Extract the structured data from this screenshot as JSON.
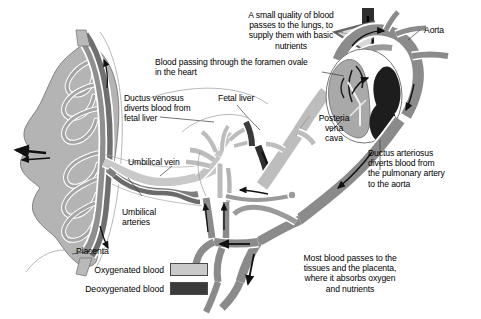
{
  "diagram": {
    "type": "anatomical-diagram"
  },
  "annotations": {
    "lungs_note": "A small quality of blood\npasses to the lungs, to\nsupply them with basic\nnutrients",
    "aorta": "Aorta",
    "foramen_ovale": "Blood passing through the foramen ovale\nin the heart",
    "ductus_venosus": "Ductus venosus\ndiverts blood from\nfetal liver",
    "fetal_liver": "Fetal liver",
    "posterior_vena_cava": "Posteria\nvena\ncava",
    "ductus_arteriosus": "Ductus arteriosus\ndiverts blood from\nthe pulmonary artery\nto the aorta",
    "umbilical_vein": "Umbilical vein",
    "umbilical_arteries": "Umbilical\narteries",
    "placenta": "Placenta",
    "tissues_note": "Most blood passes to the\ntissues and the placenta,\nwhere it absorbs oxygen\nand nutrients"
  },
  "legend": {
    "items": [
      {
        "label": "Oxygenated blood",
        "color": "#c9c9c9"
      },
      {
        "label": "Deoxygenated blood",
        "color": "#3b3b3b"
      }
    ]
  },
  "colors": {
    "oxygenated": "#c9c9c9",
    "deoxygenated": "#3b3b3b",
    "mixed": "#9a9a9a",
    "mixed_dark": "#7e7e7e",
    "placenta_body": "#b4b4b4",
    "outline": "#555555",
    "text": "#000000",
    "background": "#ffffff"
  }
}
